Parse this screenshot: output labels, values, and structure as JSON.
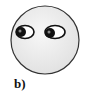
{
  "figure": {
    "caption": "b)",
    "face": {
      "fill": "#eeeeee",
      "stroke": "#333333"
    },
    "eyes": [
      {
        "position": "left",
        "gaze": "left"
      },
      {
        "position": "right",
        "gaze": "left"
      }
    ]
  }
}
